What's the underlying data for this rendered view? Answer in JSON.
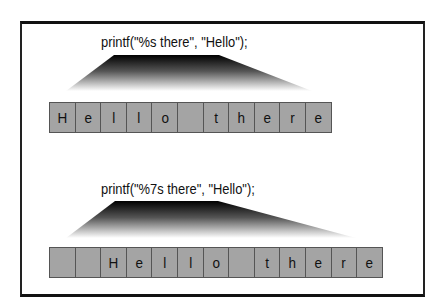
{
  "diagram": {
    "examples": [
      {
        "code": "printf(\"%s there\", \"Hello\");",
        "cells": [
          "H",
          "e",
          "l",
          "l",
          "o",
          "",
          "t",
          "h",
          "e",
          "r",
          "e"
        ]
      },
      {
        "code": "printf(\"%7s there\", \"Hello\");",
        "cells": [
          "",
          "",
          "H",
          "e",
          "l",
          "l",
          "o",
          "",
          "t",
          "h",
          "e",
          "r",
          "e"
        ]
      }
    ],
    "colors": {
      "cell_fill": "#a4a4a4",
      "cell_border": "#555555",
      "frame": "#111111"
    }
  }
}
